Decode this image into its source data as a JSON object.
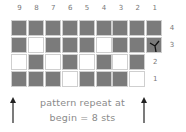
{
  "chart_title": "",
  "columns": [
    "9",
    "8",
    "7",
    "6",
    "5",
    "4",
    "3",
    "2",
    "1"
  ],
  "rows": [
    {
      "label": "4",
      "cells": [
        "D",
        "D",
        "D",
        "D",
        "D",
        "D",
        "D",
        "D",
        "D"
      ]
    },
    {
      "label": "3",
      "cells": [
        "D",
        "W",
        "D",
        "D",
        "D",
        "W",
        "D",
        "D",
        "Y"
      ]
    },
    {
      "label": "2",
      "cells": [
        "W",
        "D",
        "W",
        "D",
        "W",
        "D",
        "W",
        "D"
      ]
    },
    {
      "label": "1",
      "cells": [
        "D",
        "D",
        "D",
        "W",
        "D",
        "D",
        "D",
        "W"
      ]
    }
  ],
  "legend": {
    "D": "dark stitch",
    "W": "white stitch",
    "Y": "increase symbol"
  },
  "caption": {
    "line1": "pattern repeat at",
    "line2": "begin = 8 sts"
  },
  "colors": {
    "dark": "#7b7b7b",
    "grid": "#cfcfcf",
    "text": "#777777"
  }
}
